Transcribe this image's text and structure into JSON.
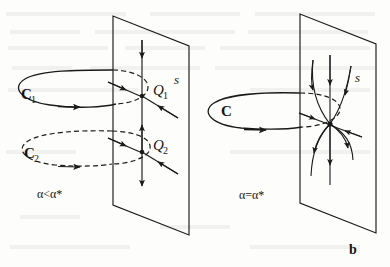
{
  "figure": {
    "kind": "phase-portrait-diagram",
    "caption_label": "b",
    "stroke_color": "#1a1a1a",
    "background_color": "#fdfdfc",
    "panels": [
      {
        "id": "panel-a",
        "parameter_label": "α<α*",
        "section_plane_label": "s",
        "cycles": [
          {
            "name": "C₁",
            "label": "C",
            "subscript": "1",
            "style": "solid",
            "direction": "clockwise-from-above"
          },
          {
            "name": "C₂",
            "label": "C",
            "subscript": "2",
            "style": "dashed",
            "direction": "clockwise-from-above"
          }
        ],
        "fixed_points": [
          {
            "name": "Q₁",
            "label": "Q",
            "subscript": "1",
            "type": "saddle"
          },
          {
            "name": "Q₂",
            "label": "Q",
            "subscript": "2",
            "type": "node"
          }
        ]
      },
      {
        "id": "panel-b",
        "parameter_label": "α=α*",
        "section_plane_label": "s",
        "cycles": [
          {
            "name": "C",
            "label": "C",
            "subscript": "",
            "style": "solid",
            "direction": "clockwise-from-above"
          }
        ],
        "fixed_points": [
          {
            "name": "Q",
            "label": "",
            "subscript": "",
            "type": "saddle-node"
          }
        ]
      }
    ]
  }
}
